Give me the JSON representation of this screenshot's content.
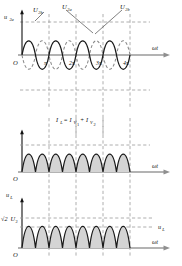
{
  "figure": {
    "type": "waveform-timing-diagram",
    "colors": {
      "curve": "#1a1a1a",
      "dashed_curve": "#8a8a8a",
      "axis": "#9a9a9a",
      "grid_dashed": "#9a9a9a",
      "fill": "#d4d4d4",
      "background": "#ffffff"
    }
  },
  "panels": [
    {
      "id": "panel-voltage",
      "y_axis_label": "u",
      "y_axis_label_sub": "2a",
      "x_axis_label": "ωt",
      "origin_label": "O",
      "x_ticks": [
        "π",
        "2π",
        "3π",
        "4π"
      ],
      "curve_labels": [
        {
          "base": "U",
          "sub": "2b",
          "target": "solid-first"
        },
        {
          "base": "U",
          "sub": "2a",
          "target": "dashed"
        },
        {
          "base": "U",
          "sub": "2b",
          "target": "solid-second"
        }
      ],
      "series": [
        {
          "name": "U2b",
          "style": "solid",
          "phase_deg": 0,
          "note": "sine starting at origin rising"
        },
        {
          "name": "U2a",
          "style": "dashed",
          "phase_deg": 180,
          "note": "sine inverted, 180 degrees out of phase"
        }
      ]
    },
    {
      "id": "panel-current",
      "equation_parts": {
        "lhs_base": "I",
        "lhs_sub": "L",
        "eq": "=",
        "t1_base": "I",
        "t1_sub": "V",
        "t1_sub2": "1",
        "plus": "+",
        "t2_base": "I",
        "t2_sub": "V",
        "t2_sub2": "2"
      },
      "equation_plain": "I_L = I_V1 + I_V2",
      "x_axis_label": "ωt",
      "origin_label": "O",
      "series": [
        {
          "name": "rectified-current",
          "style": "filled",
          "note": "full-wave rectified humps, shaded"
        }
      ]
    },
    {
      "id": "panel-load-voltage",
      "y_axis_label": "u",
      "y_axis_label_sub": "L",
      "peak_label_parts": {
        "radical": "√2",
        "base": "U",
        "sub": "2"
      },
      "peak_label_plain": "√2U2",
      "level_label_base": "u",
      "level_label_sub": "L",
      "x_axis_label": "ωt",
      "origin_label": "O",
      "series": [
        {
          "name": "load-voltage",
          "style": "filled",
          "note": "full-wave rectified humps, shaded, with mean level line"
        }
      ]
    }
  ]
}
